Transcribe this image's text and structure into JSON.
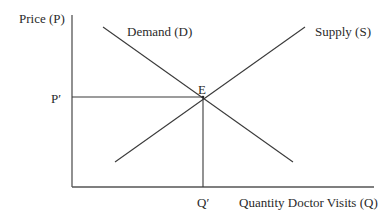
{
  "diagram": {
    "type": "supply-demand",
    "y_axis_label": "Price (P)",
    "x_axis_label": "Quantity Doctor Visits (Q)",
    "curves": [
      {
        "id": "demand",
        "label": "Demand (D)",
        "slope": "downward"
      },
      {
        "id": "supply",
        "label": "Supply (S)",
        "slope": "upward"
      }
    ],
    "equilibrium": {
      "label": "E",
      "price_label": "P′",
      "quantity_label": "Q′"
    },
    "colors": {
      "line": "#3a3a3a",
      "axis": "#555555",
      "text": "#2a2a2a"
    }
  }
}
